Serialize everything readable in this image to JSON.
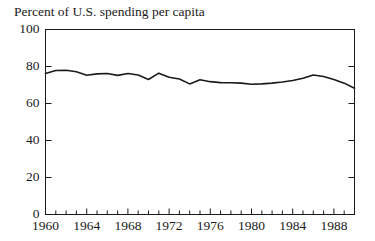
{
  "chart_data": {
    "type": "line",
    "title": "Percent of U.S. spending per capita",
    "xlabel": "",
    "ylabel": "",
    "xlim": [
      1960,
      1990
    ],
    "ylim": [
      0,
      100
    ],
    "grid": false,
    "legend": null,
    "y_ticks": [
      0,
      20,
      40,
      60,
      80,
      100
    ],
    "y_tick_labels": [
      "0",
      "20",
      "40",
      "60",
      "80",
      "100"
    ],
    "y_minor_ticks": [],
    "x_ticks": [
      1960,
      1964,
      1968,
      1972,
      1976,
      1980,
      1984,
      1988
    ],
    "x_tick_labels": [
      "1960",
      "1964",
      "1968",
      "1972",
      "1976",
      "1980",
      "1984",
      "1988"
    ],
    "x_minor_tick_interval": 1,
    "line_color": "#1a1a1a",
    "line_width": 1.6,
    "x": [
      1960,
      1961,
      1962,
      1963,
      1964,
      1965,
      1966,
      1967,
      1968,
      1969,
      1970,
      1971,
      1972,
      1973,
      1974,
      1975,
      1976,
      1977,
      1978,
      1979,
      1980,
      1981,
      1982,
      1983,
      1984,
      1985,
      1986,
      1987,
      1988,
      1989,
      1990
    ],
    "values": [
      76.2,
      77.8,
      78.0,
      77.2,
      75.3,
      76.0,
      76.2,
      75.2,
      76.2,
      75.4,
      73.0,
      76.4,
      74.2,
      73.2,
      70.6,
      72.8,
      71.8,
      71.3,
      71.2,
      71.0,
      70.4,
      70.6,
      71.0,
      71.6,
      72.4,
      73.6,
      75.4,
      74.6,
      73.0,
      71.0,
      68.2
    ]
  },
  "axes": {
    "y_axis_name": "percent-axis",
    "x_axis_name": "year-axis"
  }
}
